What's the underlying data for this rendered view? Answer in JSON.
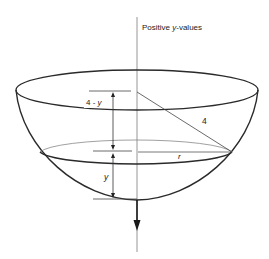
{
  "figure": {
    "axis_label": "Positive y-values",
    "axis_label_prefix": "Positive ",
    "axis_label_var": "y",
    "axis_label_suffix": "-values",
    "labels": {
      "upper_depth": "4 - y",
      "upper_depth_num": "4 - ",
      "upper_depth_var": "y",
      "radius_sphere": "4",
      "radius_surface": "r",
      "liquid_depth": "y"
    },
    "colors": {
      "stroke": "#2a2a2a",
      "thin_stroke": "#555555",
      "axis": "#888888",
      "background": "#ffffff"
    }
  }
}
